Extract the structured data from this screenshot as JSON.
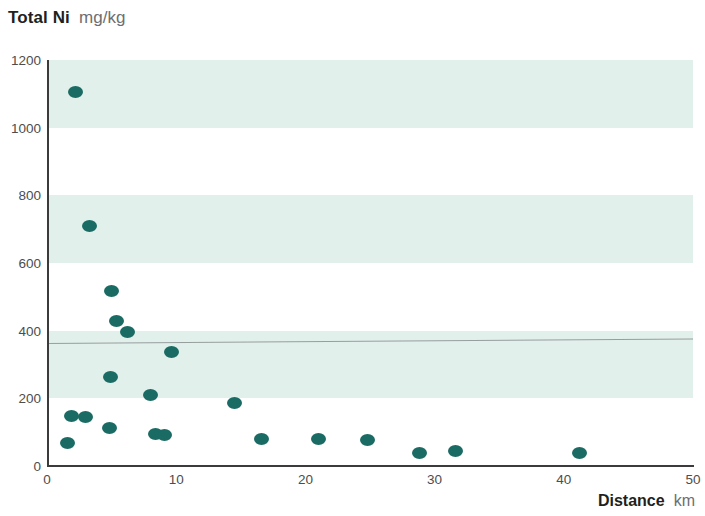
{
  "title": {
    "main": "Total Ni",
    "units": "mg/kg"
  },
  "axis_titles": {
    "x_main": "Distance",
    "x_units": "km"
  },
  "chart_data": {
    "type": "scatter",
    "title": "Total Ni mg/kg",
    "xlabel": "Distance km",
    "ylabel": "Total Ni mg/kg",
    "xlim": [
      0,
      50
    ],
    "ylim": [
      0,
      1200
    ],
    "xticks": [
      0,
      10,
      20,
      30,
      40,
      50
    ],
    "yticks": [
      0,
      200,
      400,
      600,
      800,
      1000,
      1200
    ],
    "grid": false,
    "legend": "none",
    "background_bands": {
      "color": "#e2f0ec",
      "ranges": [
        [
          200,
          400
        ],
        [
          600,
          800
        ],
        [
          1000,
          1200
        ]
      ]
    },
    "reference_line": {
      "y_left": 365,
      "y_right": 378,
      "color": "#8a8f90"
    },
    "marker_color": "#1a6b63",
    "points": [
      {
        "x": 2.2,
        "y": 1105
      },
      {
        "x": 3.3,
        "y": 708
      },
      {
        "x": 5.0,
        "y": 518
      },
      {
        "x": 5.4,
        "y": 430
      },
      {
        "x": 6.2,
        "y": 395
      },
      {
        "x": 9.6,
        "y": 337
      },
      {
        "x": 4.9,
        "y": 262
      },
      {
        "x": 8.0,
        "y": 210
      },
      {
        "x": 14.5,
        "y": 185
      },
      {
        "x": 1.9,
        "y": 148
      },
      {
        "x": 3.0,
        "y": 145
      },
      {
        "x": 4.8,
        "y": 112
      },
      {
        "x": 8.4,
        "y": 95
      },
      {
        "x": 9.1,
        "y": 93
      },
      {
        "x": 1.6,
        "y": 68
      },
      {
        "x": 16.6,
        "y": 80
      },
      {
        "x": 21.0,
        "y": 80
      },
      {
        "x": 24.8,
        "y": 78
      },
      {
        "x": 28.8,
        "y": 38
      },
      {
        "x": 31.6,
        "y": 45
      },
      {
        "x": 41.2,
        "y": 38
      }
    ]
  }
}
